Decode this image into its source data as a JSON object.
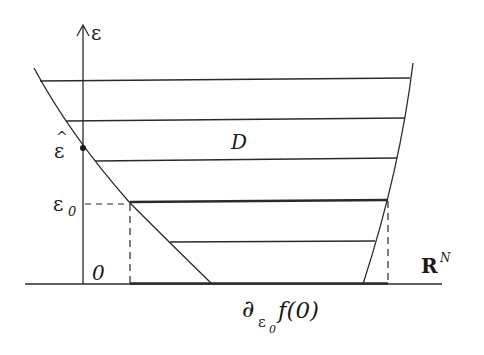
{
  "diagram": {
    "colors": {
      "ink": "#2a2a2a",
      "background": "#ffffff"
    },
    "labels": {
      "vertical_axis": "ε",
      "epsilon_hat_base": "ε",
      "epsilon_hat_accent": "^",
      "epsilon_zero_base": "ε",
      "epsilon_zero_sub": "0",
      "origin": "0",
      "region": "D",
      "space_base": "R",
      "space_sup": "N",
      "subdiff_symbol": "∂",
      "subdiff_sub_base": "ε",
      "subdiff_sub_sub": "0",
      "subdiff_func": "f(0)"
    },
    "elements": {
      "axis": {
        "x": 83,
        "y_bottom": 284,
        "y_top": 25
      },
      "baseline": {
        "x_start": 25,
        "x_end": 442,
        "y": 284
      },
      "left_curve": {
        "top": [
          34,
          68
        ],
        "bottom": [
          212,
          284
        ]
      },
      "right_curve": {
        "top": [
          413,
          63
        ],
        "bottom": [
          363,
          284
        ]
      },
      "horizontal_levels_y": [
        81,
        121,
        161,
        202,
        242
      ],
      "thick_level_y": 202,
      "epsilon_hat_point": [
        83,
        148
      ],
      "dashed_projection": {
        "left_x": 130,
        "right_x": 388,
        "y": 204
      },
      "thick_base_segment": {
        "x_start": 130,
        "x_end": 388
      }
    }
  }
}
